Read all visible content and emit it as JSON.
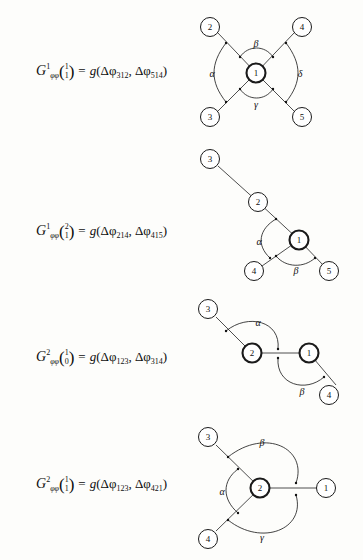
{
  "page": {
    "background_color": "#fdfdfb",
    "ink_color": "#111111",
    "type": "figure-page"
  },
  "rows": [
    {
      "id": "row-1",
      "formula": {
        "lhs_symbol": "G",
        "lhs_superscript": "1",
        "lhs_subscript": "φφ",
        "binom_top": "1",
        "binom_bottom": "1",
        "equals": "=",
        "rhs_function": "g",
        "arg1_prefix": "Δφ",
        "arg1_index": "312",
        "arg2_prefix": "Δφ",
        "arg2_index": "514",
        "comma": ",",
        "open_paren": "(",
        "close_paren": ")"
      },
      "diagram": {
        "kind": "star-5",
        "center_node": "1",
        "nodes": [
          "2",
          "4",
          "3",
          "5"
        ],
        "angles": [
          "α",
          "β",
          "δ",
          "γ"
        ]
      }
    },
    {
      "id": "row-2",
      "formula": {
        "lhs_symbol": "G",
        "lhs_superscript": "1",
        "lhs_subscript": "φφ",
        "binom_top": "2",
        "binom_bottom": "1",
        "equals": "=",
        "rhs_function": "g",
        "arg1_prefix": "Δφ",
        "arg1_index": "214",
        "arg2_prefix": "Δφ",
        "arg2_index": "415",
        "comma": ",",
        "open_paren": "(",
        "close_paren": ")"
      },
      "diagram": {
        "kind": "chain-branch",
        "center_node": "1",
        "nodes": [
          "3",
          "2",
          "4",
          "5"
        ],
        "angles": [
          "α",
          "β"
        ]
      }
    },
    {
      "id": "row-3",
      "formula": {
        "lhs_symbol": "G",
        "lhs_superscript": "2",
        "lhs_subscript": "φφ",
        "binom_top": "1",
        "binom_bottom": "0",
        "equals": "=",
        "rhs_function": "g",
        "arg1_prefix": "Δφ",
        "arg1_index": "123",
        "arg2_prefix": "Δφ",
        "arg2_index": "314",
        "comma": ",",
        "open_paren": "(",
        "close_paren": ")"
      },
      "diagram": {
        "kind": "two-center-chain",
        "center_nodes": [
          "2",
          "1"
        ],
        "nodes": [
          "3",
          "4"
        ],
        "angles": [
          "α",
          "β"
        ]
      }
    },
    {
      "id": "row-4",
      "formula": {
        "lhs_symbol": "G",
        "lhs_superscript": "2",
        "lhs_subscript": "φφ",
        "binom_top": "1",
        "binom_bottom": "1",
        "equals": "=",
        "rhs_function": "g",
        "arg1_prefix": "Δφ",
        "arg1_index": "123",
        "arg2_prefix": "Δφ",
        "arg2_index": "421",
        "comma": ",",
        "open_paren": "(",
        "close_paren": ")"
      },
      "diagram": {
        "kind": "star-3",
        "center_node": "2",
        "nodes": [
          "3",
          "1",
          "4"
        ],
        "angles": [
          "α",
          "β",
          "γ"
        ]
      }
    }
  ]
}
